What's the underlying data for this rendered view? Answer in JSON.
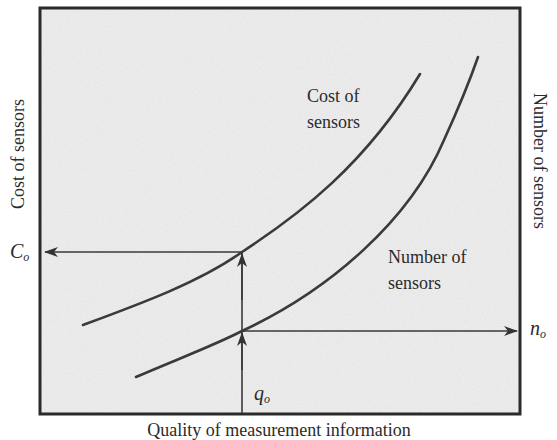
{
  "diagram": {
    "axes": {
      "left_label": "Cost of sensors",
      "right_label": "Number of sensors",
      "bottom_label": "Quality of measurement information"
    },
    "curves": [
      {
        "name": "cost-of-sensors",
        "label_line1": "Cost of",
        "label_line2": "sensors"
      },
      {
        "name": "number-of-sensors",
        "label_line1": "Number of",
        "label_line2": "sensors"
      }
    ],
    "markers": {
      "cost_value": {
        "symbol": "C",
        "subscript": "o"
      },
      "number_value": {
        "symbol": "n",
        "subscript": "o"
      },
      "quality_value": {
        "symbol": "q",
        "subscript": "o"
      }
    },
    "colors": {
      "background": "#f1f1f1",
      "frame": "#2a2a2a",
      "line": "#3a3a3a",
      "text": "#2b2b2b"
    }
  }
}
